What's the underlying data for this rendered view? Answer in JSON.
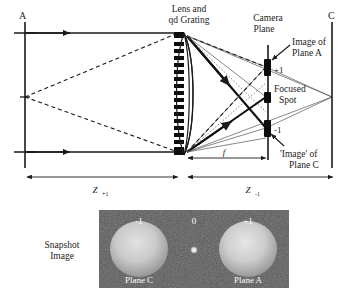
{
  "figure": {
    "title_labels": {
      "plane_a": "A",
      "plane_c": "C",
      "lens_line1": "Lens and",
      "lens_line2": "qd Grating",
      "camera_line1": "Camera",
      "camera_line2": "Plane",
      "image_of_a_line1": "Image of",
      "image_of_a_line2": "Plane A",
      "focused_line1": "Focused",
      "focused_line2": "Spot",
      "image_of_c_line1": "'Image' of",
      "image_of_c_line2": "Plane C"
    },
    "order_marks": {
      "plus_one": "+1",
      "minus_one": "-1"
    },
    "distances": {
      "z_object_symbol": "Z",
      "z_object_subscript": "+1",
      "z_image_symbol": "Z",
      "z_image_subscript": "-1",
      "focal_symbol": "f"
    },
    "snapshot": {
      "caption_line1": "Snapshot",
      "caption_line2": "Image",
      "order_minus_one": "-1",
      "order_zero": "0",
      "order_plus_one": "+1",
      "left_plane_label": "Plane C",
      "right_plane_label": "Plane A"
    },
    "colors": {
      "ink": "#1a1a1a",
      "thin_ray": "#555555",
      "panel_background": "#595959",
      "blob": "#c8c8c8",
      "panel_text": "#ffffff"
    }
  }
}
